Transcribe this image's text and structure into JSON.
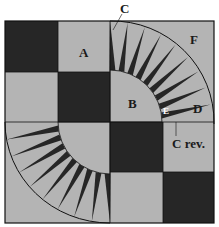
{
  "figure": {
    "top_caption_fragment": "",
    "colors": {
      "dark": "#262626",
      "light": "#b4b4b4",
      "outline": "#111111",
      "background": "#ffffff"
    },
    "grid": {
      "rows": 4,
      "cols": 4,
      "pattern": [
        [
          "dark",
          "light",
          "arc",
          "arc"
        ],
        [
          "light",
          "dark",
          "arc",
          "arc"
        ],
        [
          "arc",
          "arc",
          "dark",
          "light"
        ],
        [
          "arc",
          "arc",
          "light",
          "dark"
        ]
      ]
    },
    "labels": {
      "A": "A",
      "B": "B",
      "C": "C",
      "C_rev": "C rev.",
      "D": "D",
      "E": "E",
      "F": "F"
    },
    "spike_count_per_quadrant": 9
  }
}
